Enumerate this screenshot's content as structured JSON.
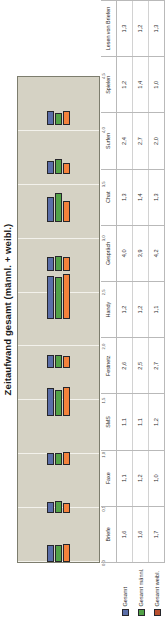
{
  "chart_data": {
    "type": "bar",
    "orientation": "horizontal",
    "title": "Zeitaufwand gesamt (männl. + weibl.)",
    "xlabel": "",
    "ylabel": "",
    "ylim": [
      0.0,
      4.5
    ],
    "grid": true,
    "legend_position": "bottom-left",
    "categories": [
      "Briefe",
      "Faxe",
      "SMS",
      "Festnetz",
      "Handy",
      "Gespräch",
      "Chat",
      "Surfen",
      "Spielen",
      "Lesen von Briefen"
    ],
    "series": [
      {
        "name": "Gesamt",
        "color": "#5b6ea8",
        "values": [
          1.6,
          1.1,
          1.1,
          2.6,
          1.2,
          4.0,
          1.3,
          2.4,
          1.2,
          1.3
        ],
        "labels": [
          "1,6",
          "1,1",
          "1,1",
          "2,6",
          "1,2",
          "4,0",
          "1,3",
          "2,4",
          "1,2",
          "1,3"
        ]
      },
      {
        "name": "Gesamt männl.",
        "color": "#52a247",
        "values": [
          1.6,
          1.2,
          1.1,
          2.5,
          1.2,
          3.9,
          1.4,
          2.7,
          1.4,
          1.2
        ],
        "labels": [
          "1,6",
          "1,2",
          "1,1",
          "2,5",
          "1,2",
          "3,9",
          "1,4",
          "2,7",
          "1,4",
          "1,2"
        ]
      },
      {
        "name": "Gesamt weibl.",
        "color": "#f4823c",
        "values": [
          1.7,
          1.0,
          1.2,
          2.7,
          1.1,
          4.2,
          1.3,
          2.0,
          1.0,
          1.3
        ],
        "labels": [
          "1,7",
          "1,0",
          "1,2",
          "2,7",
          "1,1",
          "4,2",
          "1,3",
          "2,0",
          "1,0",
          "1,3"
        ]
      }
    ],
    "axis_ticks": [
      "0,0",
      "0,5",
      "1,0",
      "1,5",
      "2,0",
      "2,5",
      "3,0",
      "3,5",
      "4,0",
      "4,5"
    ],
    "axis_tick_values": [
      0.0,
      0.5,
      1.0,
      1.5,
      2.0,
      2.5,
      3.0,
      3.5,
      4.0,
      4.5
    ]
  },
  "plot": {
    "background_color": "#d5d2c4",
    "gridline_color": "#f3f2ec",
    "border_color": "#7d7d6e"
  }
}
